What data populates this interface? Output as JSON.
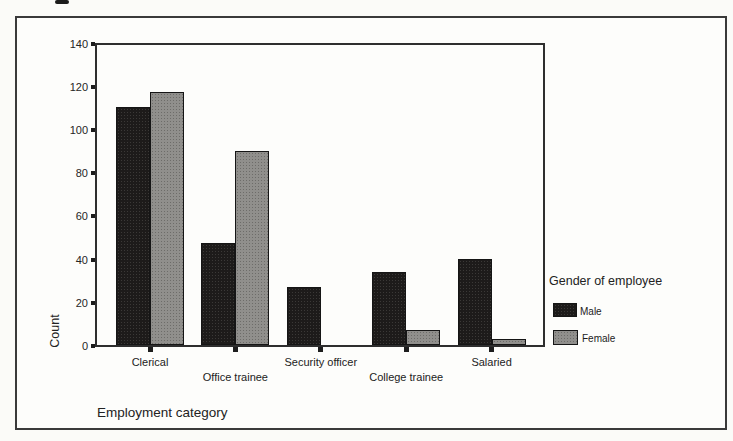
{
  "chart_data": {
    "type": "bar",
    "title": "",
    "categories": [
      "Clerical",
      "Office trainee",
      "Security officer",
      "College trainee",
      "Salaried"
    ],
    "series": [
      {
        "name": "Male",
        "color": "#1d1b1a",
        "values": [
          110,
          47,
          27,
          34,
          40
        ]
      },
      {
        "name": "Female",
        "color": "#908f8c",
        "values": [
          117,
          90,
          0,
          7,
          3
        ]
      }
    ],
    "xlabel": "Employment category",
    "ylabel": "Count",
    "ylim": [
      0,
      140
    ],
    "yticks": [
      0,
      20,
      40,
      60,
      80,
      100,
      120,
      140
    ],
    "legend_title": "Gender of employee",
    "legend_position": "right",
    "grid": false,
    "bar_style": "clustered"
  }
}
